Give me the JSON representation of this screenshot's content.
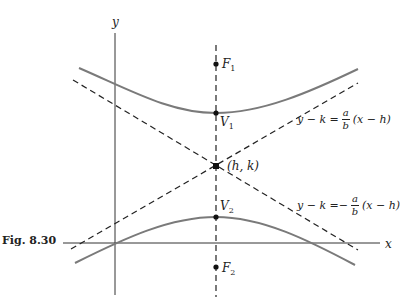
{
  "figure": {
    "caption": "Fig. 8.30",
    "axes": {
      "x_label": "x",
      "y_label": "y"
    },
    "points": {
      "focus_1": "F",
      "focus_1_sub": "1",
      "vertex_1": "V",
      "vertex_1_sub": "1",
      "center": "(h, k)",
      "vertex_2": "V",
      "vertex_2_sub": "2",
      "focus_2": "F",
      "focus_2_sub": "2"
    },
    "asymptote_pos": {
      "lhs": "y − k = ",
      "sign": "",
      "num": "a",
      "den": "b",
      "rhs": "(x − h)"
    },
    "asymptote_neg": {
      "lhs": "y − k = ",
      "sign": "−",
      "num": "a",
      "den": "b",
      "rhs": "(x − h)"
    },
    "colors": {
      "curve": "#7a7a7a",
      "axis": "#333333",
      "dash": "#222222"
    }
  }
}
